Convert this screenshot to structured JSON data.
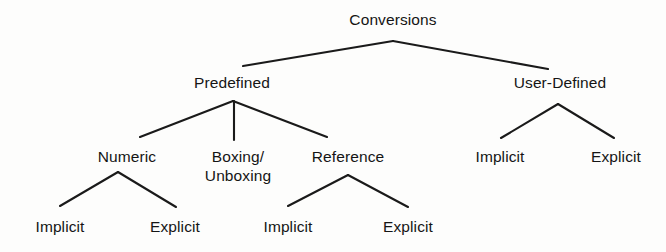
{
  "diagram": {
    "title": "Conversions",
    "type": "tree",
    "background_color": "#fdfdfc",
    "line_color": "#1a1a1a",
    "text_color": "#151515",
    "nodes": [
      {
        "id": "conversions",
        "label": "Conversions",
        "level": 0,
        "x": 393,
        "y": 10,
        "parent": null
      },
      {
        "id": "predefined",
        "label": "Predefined",
        "level": 1,
        "x": 232,
        "y": 73,
        "parent": "conversions"
      },
      {
        "id": "user-defined",
        "label": "User-Defined",
        "level": 1,
        "x": 560,
        "y": 73,
        "parent": "conversions"
      },
      {
        "id": "numeric",
        "label": "Numeric",
        "level": 2,
        "x": 127,
        "y": 147,
        "parent": "predefined"
      },
      {
        "id": "boxing-unboxing",
        "label": "Boxing/\nUnboxing",
        "level": 2,
        "x": 238,
        "y": 147,
        "parent": "predefined"
      },
      {
        "id": "reference",
        "label": "Reference",
        "level": 2,
        "x": 348,
        "y": 147,
        "parent": "predefined"
      },
      {
        "id": "ud-implicit",
        "label": "Implicit",
        "level": 2,
        "x": 500,
        "y": 147,
        "parent": "user-defined"
      },
      {
        "id": "ud-explicit",
        "label": "Explicit",
        "level": 2,
        "x": 616,
        "y": 147,
        "parent": "user-defined"
      },
      {
        "id": "num-implicit",
        "label": "Implicit",
        "level": 3,
        "x": 60,
        "y": 217,
        "parent": "numeric"
      },
      {
        "id": "num-explicit",
        "label": "Explicit",
        "level": 3,
        "x": 175,
        "y": 217,
        "parent": "numeric"
      },
      {
        "id": "ref-implicit",
        "label": "Implicit",
        "level": 3,
        "x": 288,
        "y": 217,
        "parent": "reference"
      },
      {
        "id": "ref-explicit",
        "label": "Explicit",
        "level": 3,
        "x": 408,
        "y": 217,
        "parent": "reference"
      }
    ],
    "edges": [
      {
        "from": "conversions",
        "to": "predefined",
        "x1": 393,
        "y1": 41,
        "x2": 243,
        "y2": 66
      },
      {
        "from": "conversions",
        "to": "user-defined",
        "x1": 393,
        "y1": 41,
        "x2": 548,
        "y2": 69
      },
      {
        "from": "predefined",
        "to": "numeric",
        "x1": 233,
        "y1": 101,
        "x2": 140,
        "y2": 137
      },
      {
        "from": "predefined",
        "to": "boxing-unboxing",
        "x1": 234,
        "y1": 101,
        "x2": 234,
        "y2": 140
      },
      {
        "from": "predefined",
        "to": "reference",
        "x1": 233,
        "y1": 101,
        "x2": 327,
        "y2": 137
      },
      {
        "from": "user-defined",
        "to": "ud-implicit",
        "x1": 558,
        "y1": 104,
        "x2": 501,
        "y2": 138
      },
      {
        "from": "user-defined",
        "to": "ud-explicit",
        "x1": 558,
        "y1": 104,
        "x2": 614,
        "y2": 138
      },
      {
        "from": "numeric",
        "to": "num-implicit",
        "x1": 118,
        "y1": 172,
        "x2": 60,
        "y2": 206
      },
      {
        "from": "numeric",
        "to": "num-explicit",
        "x1": 118,
        "y1": 172,
        "x2": 176,
        "y2": 207
      },
      {
        "from": "reference",
        "to": "ref-implicit",
        "x1": 348,
        "y1": 175,
        "x2": 288,
        "y2": 206
      },
      {
        "from": "reference",
        "to": "ref-explicit",
        "x1": 348,
        "y1": 175,
        "x2": 408,
        "y2": 207
      }
    ]
  }
}
